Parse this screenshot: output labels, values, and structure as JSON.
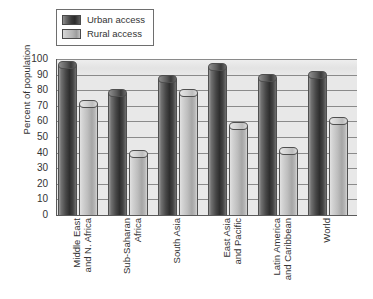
{
  "chart_data": {
    "type": "bar",
    "title": "",
    "xlabel": "",
    "ylabel": "Percent of population",
    "ylim": [
      0,
      100
    ],
    "ytick_labels": [
      "100",
      "90",
      "80",
      "70",
      "60",
      "50",
      "40",
      "30",
      "20",
      "10",
      "0"
    ],
    "grid": true,
    "legend_position": "top-left",
    "categories": [
      "Middle East and N. Africa",
      "Sub-Saharan Africa",
      "South Asia",
      "East Asia and Pacific",
      "Latin America and Caribbean",
      "World"
    ],
    "category_lines": [
      [
        "Middle East",
        "and N. Africa"
      ],
      [
        "Sub-Saharan",
        "Africa"
      ],
      [
        "South Asia",
        ""
      ],
      [
        "East Asia",
        "and Pacific"
      ],
      [
        "Latin America",
        "and Caribbean"
      ],
      [
        "World",
        ""
      ]
    ],
    "series": [
      {
        "name": "Urban access",
        "color": "#3a3a3a",
        "values": [
          96,
          78,
          87,
          95,
          88,
          90
        ]
      },
      {
        "name": "Rural access",
        "color": "#b9b9b9",
        "values": [
          71,
          39,
          78,
          57,
          41,
          60
        ]
      }
    ]
  },
  "legend": {
    "items": [
      {
        "label": "Urban access",
        "swatch": "urban-cylinder-swatch"
      },
      {
        "label": "Rural access",
        "swatch": "rural-cylinder-swatch"
      }
    ]
  },
  "axes": {
    "y_title": "Percent of population"
  }
}
